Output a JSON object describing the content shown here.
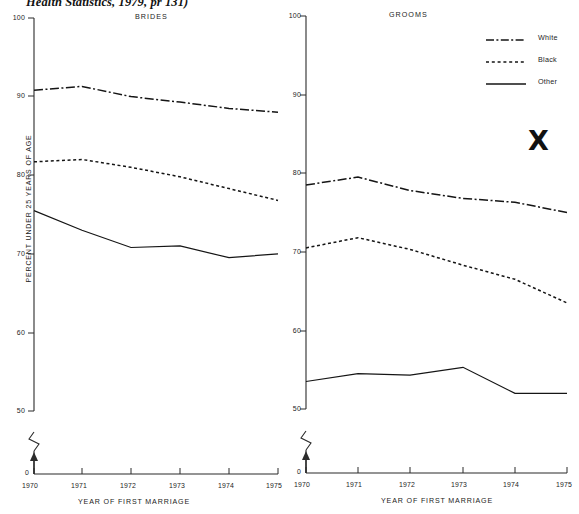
{
  "source_note": "Health Statistics, 1979, pr 131)",
  "legend": {
    "title": "",
    "items": [
      {
        "label": "White",
        "style": "dash-dot",
        "key_icon": "dash-dot-line-icon"
      },
      {
        "label": "Black",
        "style": "dotted",
        "key_icon": "dotted-line-icon"
      },
      {
        "label": "Other",
        "style": "solid",
        "key_icon": "solid-line-icon"
      }
    ]
  },
  "annotation": {
    "x_mark": "X"
  },
  "axes": {
    "y_label": "PERCENT UNDER 25 YEARS OF AGE",
    "y_ticks": [
      "100",
      "90",
      "80",
      "70",
      "60",
      "50"
    ],
    "y_zero": "0",
    "x_label": "YEAR OF FIRST MARRIAGE",
    "x_ticks": [
      "1970",
      "1971",
      "1972",
      "1973",
      "1974",
      "1975"
    ]
  },
  "panels": [
    {
      "title": "BRIDES"
    },
    {
      "title": "GROOMS"
    }
  ],
  "chart_data": [
    {
      "type": "line",
      "title": "BRIDES",
      "xlabel": "YEAR OF FIRST MARRIAGE",
      "ylabel": "PERCENT UNDER 25 YEARS OF AGE",
      "x": [
        1970,
        1971,
        1972,
        1973,
        1974,
        1975
      ],
      "xlim": [
        1970,
        1975
      ],
      "ylim": [
        50,
        100
      ],
      "y_axis_broken_below": 50,
      "grid": false,
      "legend_position": "upper-right-outside",
      "series": [
        {
          "name": "White",
          "style": "dash-dot",
          "values": [
            90.8,
            91.3,
            90.0,
            89.3,
            88.5,
            88.0
          ]
        },
        {
          "name": "Black",
          "style": "dotted",
          "values": [
            81.7,
            82.0,
            81.0,
            79.8,
            78.3,
            76.8
          ]
        },
        {
          "name": "Other",
          "style": "solid",
          "values": [
            75.5,
            73.0,
            70.8,
            71.0,
            69.5,
            70.0
          ]
        }
      ]
    },
    {
      "type": "line",
      "title": "GROOMS",
      "xlabel": "YEAR OF FIRST MARRIAGE",
      "ylabel": "PERCENT UNDER 25 YEARS OF AGE",
      "x": [
        1970,
        1971,
        1972,
        1973,
        1974,
        1975
      ],
      "xlim": [
        1970,
        1975
      ],
      "ylim": [
        50,
        100
      ],
      "y_axis_broken_below": 50,
      "grid": false,
      "legend_position": "upper-right-outside",
      "series": [
        {
          "name": "White",
          "style": "dash-dot",
          "values": [
            78.5,
            79.5,
            77.8,
            76.8,
            76.3,
            75.0
          ]
        },
        {
          "name": "Black",
          "style": "dotted",
          "values": [
            70.5,
            71.8,
            70.3,
            68.3,
            66.5,
            63.5
          ]
        },
        {
          "name": "Other",
          "style": "solid",
          "values": [
            53.5,
            54.5,
            54.3,
            55.3,
            52.0,
            52.0
          ]
        }
      ]
    }
  ]
}
